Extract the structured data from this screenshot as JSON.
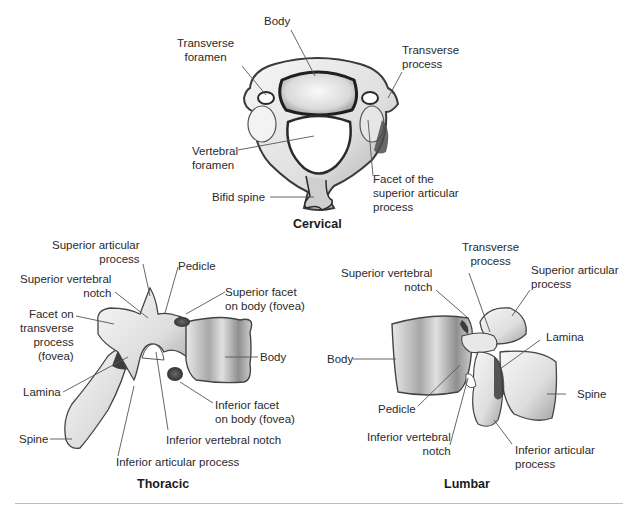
{
  "figure": {
    "panels": [
      {
        "id": "cervical",
        "caption": "Cervical",
        "labels": [
          {
            "id": "body",
            "text": "Body"
          },
          {
            "id": "transverse-foramen",
            "text": "Transverse\nforamen"
          },
          {
            "id": "transverse-process",
            "text": "Transverse\nprocess"
          },
          {
            "id": "vertebral-foramen",
            "text": "Vertebral\nforamen"
          },
          {
            "id": "facet-superior-articular",
            "text": "Facet of the\nsuperior articular\nprocess"
          },
          {
            "id": "bifid-spine",
            "text": "Bifid spine"
          }
        ]
      },
      {
        "id": "thoracic",
        "caption": "Thoracic",
        "labels": [
          {
            "id": "superior-articular-process",
            "text": "Superior articular\nprocess"
          },
          {
            "id": "pedicle",
            "text": "Pedicle"
          },
          {
            "id": "superior-vertebral-notch",
            "text": "Superior vertebral\nnotch"
          },
          {
            "id": "superior-facet-body",
            "text": "Superior facet\non body (fovea)"
          },
          {
            "id": "facet-transverse-process",
            "text": "Facet on\ntransverse\nprocess\n(fovea)"
          },
          {
            "id": "body",
            "text": "Body"
          },
          {
            "id": "lamina",
            "text": "Lamina"
          },
          {
            "id": "inferior-facet-body",
            "text": "Inferior facet\non body (fovea)"
          },
          {
            "id": "spine",
            "text": "Spine"
          },
          {
            "id": "inferior-vertebral-notch",
            "text": "Inferior vertebral notch"
          },
          {
            "id": "inferior-articular-process",
            "text": "Inferior articular process"
          }
        ]
      },
      {
        "id": "lumbar",
        "caption": "Lumbar",
        "labels": [
          {
            "id": "transverse-process",
            "text": "Transverse\nprocess"
          },
          {
            "id": "superior-vertebral-notch",
            "text": "Superior vertebral\nnotch"
          },
          {
            "id": "superior-articular-process",
            "text": "Superior articular\nprocess"
          },
          {
            "id": "lamina",
            "text": "Lamina"
          },
          {
            "id": "body",
            "text": "Body"
          },
          {
            "id": "spine",
            "text": "Spine"
          },
          {
            "id": "pedicle",
            "text": "Pedicle"
          },
          {
            "id": "inferior-vertebral-notch",
            "text": "Inferior vertebral\nnotch"
          },
          {
            "id": "inferior-articular-process",
            "text": "Inferior articular\nprocess"
          }
        ]
      }
    ]
  },
  "colors": {
    "bone_light": "#f2f2f2",
    "bone_mid": "#bdbdbd",
    "bone_dark": "#4a4a4a",
    "leader_line": "#555555",
    "rule": "#bdbdbd"
  }
}
